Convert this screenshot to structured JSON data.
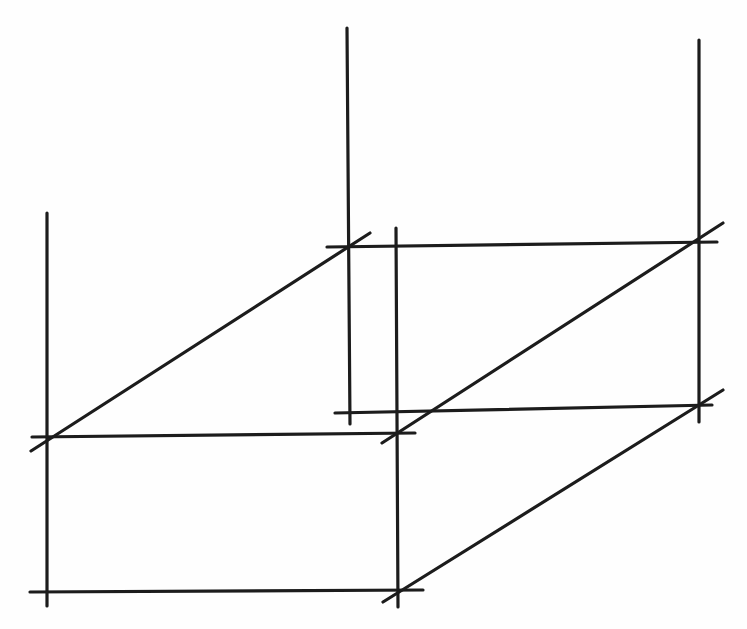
{
  "figure": {
    "background_color": "#fefefe",
    "stroke_color": "#1c1c1c",
    "stroke_width": 3.2,
    "canvas": {
      "width": 747,
      "height": 629
    },
    "lines": [
      {
        "name": "front-left-vertical-edge",
        "role": "vertical through front-left vertices, extended above top face",
        "x1": 47,
        "y1": 213,
        "x2": 47,
        "y2": 606
      },
      {
        "name": "back-left-vertical-edge",
        "role": "vertical through back-left vertices, extended above top face",
        "x1": 347,
        "y1": 28,
        "x2": 350,
        "y2": 424
      },
      {
        "name": "front-right-vertical-edge",
        "role": "vertical through front-right vertices, extended above top face",
        "x1": 396,
        "y1": 228,
        "x2": 398,
        "y2": 607
      },
      {
        "name": "back-right-vertical-edge",
        "role": "vertical through back-right vertices, extended above top face",
        "x1": 699,
        "y1": 40,
        "x2": 699,
        "y2": 422
      },
      {
        "name": "top-back-horizontal-edge",
        "role": "top face rear edge",
        "x1": 327,
        "y1": 247,
        "x2": 717,
        "y2": 242
      },
      {
        "name": "top-front-horizontal-edge",
        "role": "top face front edge",
        "x1": 32,
        "y1": 437,
        "x2": 415,
        "y2": 433
      },
      {
        "name": "bottom-back-horizontal-edge",
        "role": "bottom face rear edge",
        "x1": 335,
        "y1": 413,
        "x2": 712,
        "y2": 405
      },
      {
        "name": "bottom-front-horizontal-edge",
        "role": "bottom face front edge",
        "x1": 30,
        "y1": 592,
        "x2": 423,
        "y2": 590
      },
      {
        "name": "top-left-depth-edge",
        "role": "top face left receding edge (front-left to back-left)",
        "x1": 31,
        "y1": 451,
        "x2": 370,
        "y2": 233
      },
      {
        "name": "top-right-depth-edge",
        "role": "top face right receding edge (front-right to back-right)",
        "x1": 382,
        "y1": 443,
        "x2": 723,
        "y2": 223
      },
      {
        "name": "bottom-right-depth-edge",
        "role": "bottom face right receding edge (front-right to back-right)",
        "x1": 383,
        "y1": 602,
        "x2": 723,
        "y2": 390
      }
    ]
  }
}
